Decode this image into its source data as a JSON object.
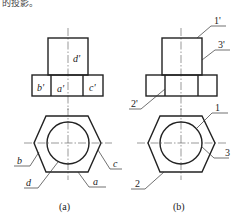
{
  "top_fragment": "的投影。",
  "figure_a": {
    "caption": "(a)",
    "front_labels": {
      "d": "d'",
      "b": "b'",
      "a": "a'",
      "c": "c'"
    },
    "top_labels": {
      "b": "b",
      "c": "c",
      "d": "d",
      "a": "a"
    }
  },
  "figure_b": {
    "caption": "(b)",
    "front_labels": {
      "one": "1'",
      "three": "3'",
      "two": "2'"
    },
    "top_labels": {
      "one": "1",
      "three": "3",
      "two": "2"
    }
  }
}
